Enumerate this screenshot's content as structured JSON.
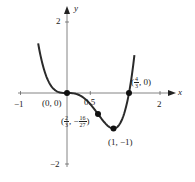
{
  "chart_data": {
    "type": "line",
    "title": "",
    "function": "f(x) = 3x^4 - 4x^3",
    "xlabel": "x",
    "ylabel": "y",
    "xlim": [
      -1,
      2.2
    ],
    "ylim": [
      -2,
      2.3
    ],
    "x_ticks": [
      {
        "value": -1,
        "label": "−1"
      },
      {
        "value": 0.5,
        "label": "0.5"
      },
      {
        "value": 2,
        "label": "2"
      }
    ],
    "y_ticks": [
      {
        "value": 2,
        "label": "2"
      },
      {
        "value": -2,
        "label": "−2"
      }
    ],
    "grid": false,
    "legend": null,
    "series": [
      {
        "name": "curve",
        "x": [
          -0.62,
          -0.5,
          -0.4,
          -0.3,
          -0.2,
          -0.1,
          0,
          0.1,
          0.2,
          0.3,
          0.4,
          0.5,
          0.6,
          0.667,
          0.7,
          0.8,
          0.9,
          1.0,
          1.1,
          1.2,
          1.3,
          1.333,
          1.4,
          1.45
        ],
        "y": [
          1.3,
          0.69,
          0.33,
          0.13,
          0.04,
          0.004,
          0,
          -0.0037,
          -0.027,
          -0.084,
          -0.179,
          -0.3125,
          -0.475,
          -0.593,
          -0.652,
          -0.819,
          -0.948,
          -1.0,
          -0.932,
          -0.691,
          -0.219,
          0,
          0.538,
          1.006
        ]
      }
    ],
    "points": [
      {
        "x": 0,
        "y": 0,
        "label": "(0, 0)"
      },
      {
        "x": 0.6667,
        "y": -0.5926,
        "label_num_x": "2",
        "label_den_x": "3",
        "label_num_y": "16",
        "label_den_y": "27"
      },
      {
        "x": 1,
        "y": -1,
        "label": "(1, −1)"
      },
      {
        "x": 1.3333,
        "y": 0,
        "label_num_x": "4",
        "label_den_x": "3",
        "label_y": "0"
      }
    ]
  },
  "labels": {
    "x_axis": "x",
    "y_axis": "y",
    "tick_neg1": "−1",
    "tick_05": "0.5",
    "tick_2x": "2",
    "tick_2y": "2",
    "tick_neg2": "−2",
    "pt_origin": "(0, 0)",
    "pt_min": "(1, −1)",
    "pt_root_open": "(",
    "pt_root_num": "4",
    "pt_root_den": "3",
    "pt_root_close": ", 0)",
    "pt_infl_open": "(",
    "pt_infl_xnum": "2",
    "pt_infl_xden": "3",
    "pt_infl_sep": ", −",
    "pt_infl_ynum": "16",
    "pt_infl_yden": "27",
    "pt_infl_close": ")"
  },
  "colors": {
    "curve": "#2a2a2a",
    "axis": "#555555",
    "text": "#222222"
  }
}
